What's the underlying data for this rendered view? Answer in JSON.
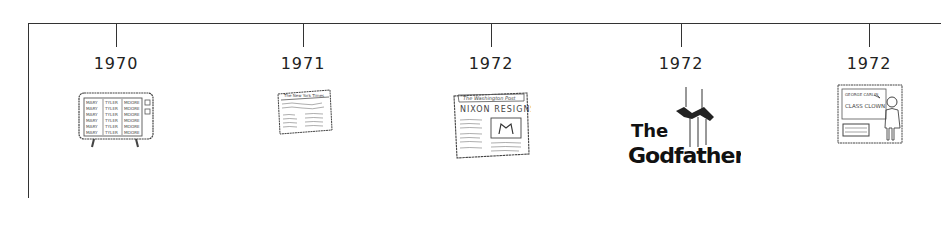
{
  "timeline": {
    "events": [
      {
        "year": "1970",
        "x": 116,
        "illustration": "tv-icon",
        "caption_lines": [
          "MARY",
          "TYLER",
          "MOORE"
        ]
      },
      {
        "year": "1971",
        "x": 303,
        "illustration": "newspaper-icon",
        "masthead": "The New York Times"
      },
      {
        "year": "1972",
        "x": 491,
        "illustration": "newspaper-icon",
        "masthead": "The Washington Post",
        "headline": "NIXON RESIGNS"
      },
      {
        "year": "1972",
        "x": 681,
        "illustration": "godfather-logo-icon",
        "title_line1": "The",
        "title_line2": "Godfather"
      },
      {
        "year": "1972",
        "x": 869,
        "illustration": "chalkboard-teacher-icon",
        "board_line1": "GEORGE CARLIN",
        "board_line2": "CLASS CLOWN"
      }
    ]
  }
}
